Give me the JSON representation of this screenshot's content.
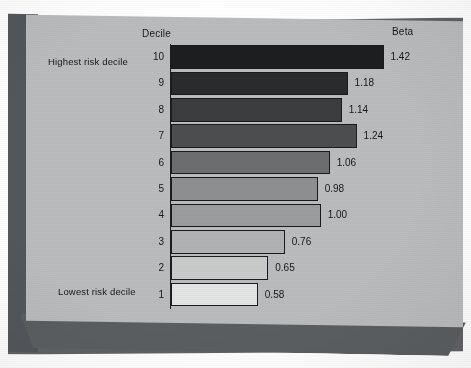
{
  "chart_data": {
    "type": "bar",
    "orientation": "horizontal",
    "title": "",
    "xlabel": "Beta",
    "ylabel": "Decile",
    "grid": false,
    "legend": null,
    "column_headers": {
      "category": "Decile",
      "value": "Beta"
    },
    "annotations": {
      "top_row": "Highest risk decile",
      "bottom_row": "Lowest risk decile"
    },
    "categories": [
      "10",
      "9",
      "8",
      "7",
      "6",
      "5",
      "4",
      "3",
      "2",
      "1"
    ],
    "values": [
      1.42,
      1.18,
      1.14,
      1.24,
      1.06,
      0.98,
      1.0,
      0.76,
      0.65,
      0.58
    ],
    "value_labels": [
      "1.42",
      "1.18",
      "1.14",
      "1.24",
      "1.06",
      "0.98",
      "1.00",
      "0.76",
      "0.65",
      "0.58"
    ],
    "xlim": [
      0,
      1.55
    ],
    "bar_colors": [
      "#1d1e20",
      "#2a2b2d",
      "#3b3d3f",
      "#4c4e50",
      "#6c6e70",
      "#8d8f90",
      "#9a9c9d",
      "#b0b2b3",
      "#c9cbcb",
      "#e3e4e4"
    ]
  },
  "rows": [
    {
      "decile": "10",
      "value_label": "1.42",
      "side_label": "Highest risk decile"
    },
    {
      "decile": "9",
      "value_label": "1.18",
      "side_label": ""
    },
    {
      "decile": "8",
      "value_label": "1.14",
      "side_label": ""
    },
    {
      "decile": "7",
      "value_label": "1.24",
      "side_label": ""
    },
    {
      "decile": "6",
      "value_label": "1.06",
      "side_label": ""
    },
    {
      "decile": "5",
      "value_label": "0.98",
      "side_label": ""
    },
    {
      "decile": "4",
      "value_label": "1.00",
      "side_label": ""
    },
    {
      "decile": "3",
      "value_label": "0.76",
      "side_label": ""
    },
    {
      "decile": "2",
      "value_label": "0.65",
      "side_label": ""
    },
    {
      "decile": "1",
      "value_label": "0.58",
      "side_label": "Lowest risk decile"
    }
  ],
  "headers": {
    "decile": "Decile",
    "beta": "Beta"
  },
  "side_labels": {
    "highest": "Highest risk decile",
    "lowest": "Lowest risk decile"
  },
  "colors": {
    "page_background": "#ffffff",
    "chart_face": "#b9bbbc",
    "slab_side": "#53565a",
    "slab_bottom": "#5b5e61",
    "text": "#17181a",
    "bar_outline": "#1a1b1d"
  }
}
